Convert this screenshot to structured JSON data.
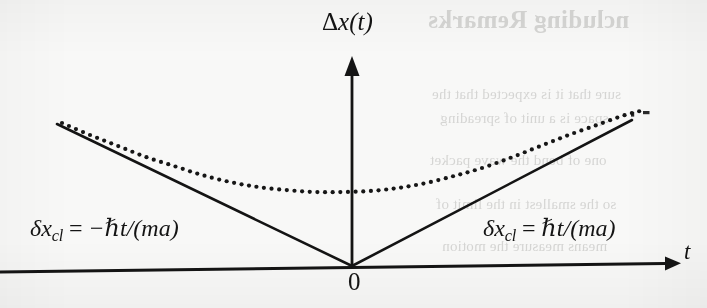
{
  "figure": {
    "background_color": "#f8f8f7",
    "ink_color": "#141414",
    "axes": {
      "y_axis_label": "Δx(t)",
      "y_axis_label_delta": "Δ",
      "y_axis_label_var": "x",
      "y_axis_label_arg": "(t)",
      "x_axis_label": "t",
      "origin_label": "0"
    },
    "annotations": {
      "left_equation": "δx_cl = −ℏt/(ma)",
      "left_equation_parts": {
        "delta": "δ",
        "var": "x",
        "subscript": "cl",
        "equals": "=",
        "rhs": "−ℏt/(ma)"
      },
      "right_equation": "δx_cl = ℏt/(ma)",
      "right_equation_parts": {
        "delta": "δ",
        "var": "x",
        "subscript": "cl",
        "equals": "=",
        "rhs": "ℏt/(ma)"
      }
    },
    "bleed_through_text": {
      "title": "ncluding Remarks",
      "line1": "sure that it is expected that the",
      "line2": "space is a unit of spreading",
      "line3": "one of bend the wave packet",
      "line4": "so the smallest in the limit of",
      "line5": "means measure the motion"
    }
  },
  "chart_data": {
    "type": "line",
    "title": "",
    "xlabel": "t",
    "ylabel": "Δx(t)",
    "grid": false,
    "legend": null,
    "axis_style": "arrowed-cartesian",
    "xlim": [
      -3.4,
      3.6
    ],
    "ylim": [
      0,
      2.4
    ],
    "origin_px": [
      352,
      266
    ],
    "series": [
      {
        "name": "δx_cl = ℏt/(ma) (classical, right branch)",
        "style": "solid",
        "linewidth": 2.6,
        "points_px": [
          [
            352,
            266
          ],
          [
            632,
            120
          ]
        ]
      },
      {
        "name": "δx_cl = −ℏt/(ma) (classical, left branch)",
        "style": "solid",
        "linewidth": 2.6,
        "points_px": [
          [
            352,
            266
          ],
          [
            57,
            124
          ]
        ]
      },
      {
        "name": "Δx(t) quantum spreading (hyperbola)",
        "style": "dotted",
        "dot_radius": 2.1,
        "dot_spacing_px": 7.5,
        "minimum_px": [
          330,
          192
        ],
        "points_px": [
          [
            62,
            123
          ],
          [
            90,
            135
          ],
          [
            118,
            146
          ],
          [
            146,
            157
          ],
          [
            174,
            166
          ],
          [
            202,
            175
          ],
          [
            230,
            182
          ],
          [
            258,
            187
          ],
          [
            286,
            190
          ],
          [
            314,
            192
          ],
          [
            342,
            192
          ],
          [
            370,
            191
          ],
          [
            398,
            188
          ],
          [
            426,
            183
          ],
          [
            454,
            176
          ],
          [
            482,
            168
          ],
          [
            510,
            158
          ],
          [
            538,
            147
          ],
          [
            566,
            136
          ],
          [
            594,
            126
          ],
          [
            622,
            116
          ],
          [
            640,
            111
          ]
        ]
      }
    ]
  }
}
